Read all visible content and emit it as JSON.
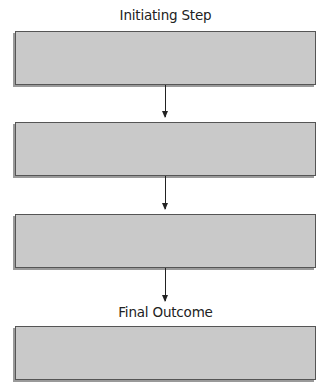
{
  "diagram": {
    "type": "vertical-flowchart",
    "top_label": "Initiating Step",
    "bottom_label": "Final Outcome",
    "boxes": [
      {
        "text": ""
      },
      {
        "text": ""
      },
      {
        "text": ""
      },
      {
        "text": ""
      }
    ],
    "colors": {
      "box_fill": "#c9c9c9",
      "box_border": "#555555",
      "arrow": "#222222",
      "text": "#222222"
    }
  }
}
